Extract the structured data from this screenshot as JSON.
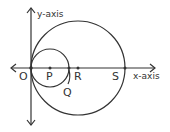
{
  "diagram": {
    "axes": {
      "x_label": "x-axis",
      "y_label": "y-axis"
    },
    "points": {
      "O": "O",
      "P": "P",
      "Q": "Q",
      "R": "R",
      "S": "S"
    },
    "circles": [
      {
        "name": "small-circle",
        "center": "P",
        "passes_through": [
          "O",
          "Q"
        ]
      },
      {
        "name": "large-circle",
        "center": "R",
        "passes_through": [
          "O",
          "S"
        ]
      }
    ],
    "stroke_color": "#333333"
  }
}
